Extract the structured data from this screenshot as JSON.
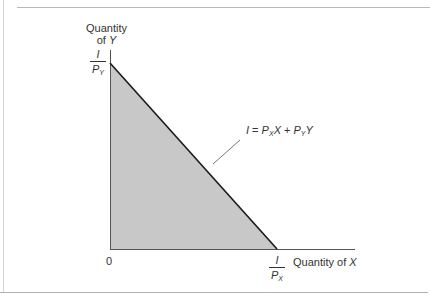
{
  "diagram": {
    "type": "budget-constraint",
    "y_axis_label": {
      "line1": "Quantity",
      "line2_prefix": "of ",
      "line2_var": "Y"
    },
    "x_axis_label": {
      "prefix": "Quantity of ",
      "var": "X"
    },
    "origin_label": "0",
    "y_intercept": {
      "numerator": "I",
      "denominator": "P",
      "subscript": "Y"
    },
    "x_intercept": {
      "numerator": "I",
      "denominator": "P",
      "subscript": "X"
    },
    "budget_line_equation": {
      "lhs": "I",
      "equals": " = ",
      "term1_coef": "P",
      "term1_sub": "X",
      "term1_var": "X",
      "plus": " + ",
      "term2_coef": "P",
      "term2_sub": "Y",
      "term2_var": "Y"
    },
    "colors": {
      "feasible_region_fill": "#c8c8c8",
      "budget_line": "#1a1a1a",
      "axes": "#555555",
      "frame": "#b8b8b8"
    },
    "geometry": {
      "origin": [
        110,
        249
      ],
      "y_axis_top": [
        110,
        50
      ],
      "x_axis_end": [
        355,
        249
      ],
      "y_intercept_point": [
        110,
        63
      ],
      "x_intercept_point": [
        277,
        249
      ],
      "pointer_line": [
        [
          213,
          164
        ],
        [
          240,
          140
        ]
      ]
    }
  }
}
